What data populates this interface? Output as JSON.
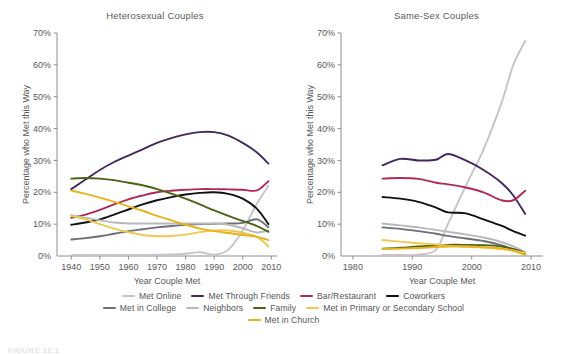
{
  "figure": {
    "caption": "FIGURE 12.1"
  },
  "legend": {
    "rows": [
      [
        {
          "label": "Met Online",
          "color": "#c9c2cc"
        },
        {
          "label": "Met Through Friends",
          "color": "#42285f"
        },
        {
          "label": "Bar/Restaurant",
          "color": "#b02a57"
        },
        {
          "label": "Coworkers",
          "color": "#111111"
        }
      ],
      [
        {
          "label": "Met in College",
          "color": "#6b7078"
        },
        {
          "label": "Neighbors",
          "color": "#b9b9bb"
        },
        {
          "label": "Family",
          "color": "#4d6317"
        },
        {
          "label": "Met in Primary or Secondary School",
          "color": "#efc850"
        }
      ],
      [
        {
          "label": "Met in Church",
          "color": "#e8b21a"
        }
      ]
    ]
  },
  "chart_data": [
    {
      "type": "line",
      "title": "Heterosexual Couples",
      "xlabel": "Year Couple Met",
      "ylabel": "Percentage who Met this Way",
      "xlim": [
        1935,
        2012
      ],
      "ylim": [
        0,
        70
      ],
      "xticks": [
        1940,
        1950,
        1960,
        1970,
        1980,
        1990,
        2000,
        2010
      ],
      "yticks": [
        0,
        10,
        20,
        30,
        40,
        50,
        60,
        70
      ],
      "ytick_labels": [
        "0%",
        "10%",
        "20%",
        "30%",
        "40%",
        "50%",
        "60%",
        "70%"
      ],
      "grid": false,
      "legend_position": "below-figure",
      "x": [
        1940,
        1945,
        1950,
        1955,
        1960,
        1965,
        1970,
        1975,
        1980,
        1985,
        1990,
        1995,
        2000,
        2005,
        2009
      ],
      "series": [
        {
          "name": "Met Online",
          "color": "#c9c2cc",
          "values": [
            0.3,
            0.3,
            0.3,
            0.3,
            0.3,
            0.3,
            0.4,
            0.5,
            0.7,
            1.2,
            0.4,
            2.0,
            8.0,
            16.5,
            22.0
          ]
        },
        {
          "name": "Met Through Friends",
          "color": "#42285f",
          "values": [
            21.0,
            24.0,
            27.0,
            29.5,
            31.5,
            33.5,
            35.5,
            37.0,
            38.2,
            38.9,
            38.9,
            37.8,
            35.5,
            32.5,
            29.0
          ]
        },
        {
          "name": "Bar/Restaurant",
          "color": "#b02a57",
          "values": [
            12.0,
            13.0,
            14.5,
            16.2,
            17.8,
            19.0,
            20.0,
            20.5,
            20.8,
            21.0,
            21.0,
            20.9,
            20.8,
            20.6,
            23.5
          ]
        },
        {
          "name": "Coworkers",
          "color": "#111111",
          "values": [
            9.8,
            10.5,
            11.5,
            13.0,
            14.6,
            16.2,
            17.5,
            18.5,
            19.3,
            19.8,
            20.0,
            19.5,
            18.0,
            14.8,
            10.0
          ]
        },
        {
          "name": "Met in College",
          "color": "#6b7078",
          "values": [
            5.2,
            5.6,
            6.2,
            7.0,
            7.8,
            8.4,
            9.0,
            9.4,
            9.8,
            10.0,
            10.1,
            10.2,
            10.4,
            11.5,
            9.0
          ]
        },
        {
          "name": "Neighbors",
          "color": "#b9b9bb",
          "values": [
            12.8,
            12.0,
            11.2,
            10.5,
            10.2,
            10.2,
            10.2,
            10.2,
            10.2,
            10.2,
            10.2,
            9.8,
            8.7,
            7.4,
            8.0
          ]
        },
        {
          "name": "Family",
          "color": "#4d6317",
          "values": [
            24.3,
            24.5,
            24.3,
            23.8,
            23.0,
            22.2,
            21.0,
            19.6,
            18.0,
            16.2,
            14.3,
            12.6,
            11.0,
            9.4,
            7.6
          ]
        },
        {
          "name": "Met in Primary or Secondary School",
          "color": "#efc850",
          "values": [
            12.6,
            11.5,
            10.0,
            8.6,
            7.5,
            6.6,
            6.2,
            6.3,
            6.7,
            7.5,
            8.0,
            8.0,
            7.3,
            6.0,
            3.0
          ]
        },
        {
          "name": "Met in Church",
          "color": "#e8b21a",
          "values": [
            20.5,
            19.5,
            18.3,
            17.0,
            15.6,
            14.2,
            12.6,
            11.2,
            9.8,
            8.6,
            7.8,
            7.2,
            6.6,
            6.0,
            5.0
          ]
        }
      ]
    },
    {
      "type": "line",
      "title": "Same-Sex Couples",
      "xlabel": "Year Couple Met",
      "ylabel": "Percentage who Met this Way",
      "xlim": [
        1978,
        2012
      ],
      "ylim": [
        0,
        70
      ],
      "xticks": [
        1980,
        1990,
        2000,
        2010
      ],
      "yticks": [
        0,
        10,
        20,
        30,
        40,
        50,
        60,
        70
      ],
      "ytick_labels": [
        "0%",
        "10%",
        "20%",
        "30%",
        "40%",
        "50%",
        "60%",
        "70%"
      ],
      "grid": false,
      "legend_position": "below-figure",
      "x": [
        1985,
        1988,
        1991,
        1994,
        1996,
        1999,
        2002,
        2005,
        2007,
        2009
      ],
      "series": [
        {
          "name": "Met Online",
          "color": "#c9c2cc",
          "values": [
            0.3,
            0.3,
            0.4,
            2.0,
            10.0,
            22.0,
            33.5,
            48.0,
            60.0,
            67.5
          ]
        },
        {
          "name": "Met Through Friends",
          "color": "#42285f",
          "values": [
            28.5,
            30.5,
            30.0,
            30.2,
            32.0,
            30.0,
            27.0,
            23.0,
            19.0,
            13.2
          ]
        },
        {
          "name": "Bar/Restaurant",
          "color": "#b02a57",
          "values": [
            24.3,
            24.5,
            24.2,
            23.0,
            22.5,
            21.5,
            20.0,
            17.5,
            17.5,
            20.5
          ]
        },
        {
          "name": "Coworkers",
          "color": "#111111",
          "values": [
            18.5,
            18.0,
            17.0,
            15.2,
            13.7,
            13.4,
            11.5,
            9.5,
            7.8,
            6.4
          ]
        },
        {
          "name": "Met in College",
          "color": "#6b7078",
          "values": [
            9.0,
            8.5,
            7.8,
            7.0,
            6.3,
            5.5,
            4.7,
            3.4,
            2.0,
            0.5
          ]
        },
        {
          "name": "Neighbors",
          "color": "#b9b9bb",
          "values": [
            10.2,
            9.6,
            9.0,
            8.2,
            7.6,
            6.8,
            5.8,
            4.4,
            3.0,
            1.2
          ]
        },
        {
          "name": "Family",
          "color": "#4d6317",
          "values": [
            2.3,
            2.6,
            3.0,
            3.3,
            3.5,
            3.5,
            3.4,
            3.0,
            2.2,
            1.0
          ]
        },
        {
          "name": "Met in Primary or Secondary School",
          "color": "#efc850",
          "values": [
            5.0,
            4.5,
            4.0,
            3.6,
            3.2,
            2.9,
            2.6,
            2.2,
            1.7,
            1.0
          ]
        },
        {
          "name": "Met in Church",
          "color": "#e8b21a",
          "values": [
            2.2,
            2.3,
            2.5,
            2.8,
            3.0,
            3.0,
            2.8,
            2.4,
            1.6,
            0.4
          ]
        }
      ]
    }
  ]
}
